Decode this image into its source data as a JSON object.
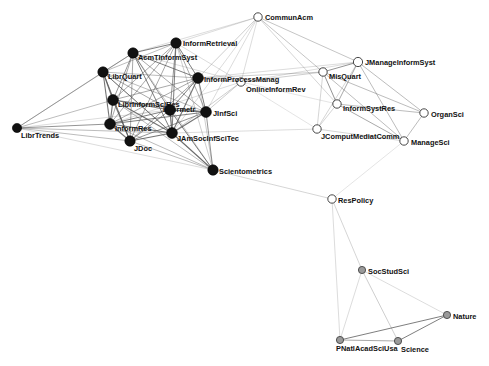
{
  "figure": {
    "type": "network-graph",
    "title": "",
    "background_color": "#ffffff",
    "edge_color": "#555555",
    "label_color": "#111111",
    "node_styles": {
      "black": {
        "fill": "#111111",
        "stroke": "#000000",
        "description": "filled black node"
      },
      "white": {
        "fill": "#ffffff",
        "stroke": "#333333",
        "description": "hollow white node"
      },
      "gray": {
        "fill": "#9a9a9a",
        "stroke": "#444444",
        "description": "gray node"
      }
    }
  },
  "chart_data": {
    "type": "scatter",
    "title": "",
    "xlabel": "",
    "ylabel": "",
    "legend": [],
    "nodes": [
      {
        "id": "CommunAcm",
        "label": "CommunAcm",
        "x": 258,
        "y": 17,
        "r": 4.2,
        "style": "white",
        "label_dx": 7,
        "label_dy": 3
      },
      {
        "id": "JAmSocInformRetr",
        "label": "InformRetrieval",
        "x": 176,
        "y": 43,
        "r": 5.2,
        "style": "black",
        "label_dx": 7,
        "label_dy": 3
      },
      {
        "id": "AcmTInformSyst",
        "label": "AcmTInformSyst",
        "x": 133,
        "y": 53,
        "r": 5.2,
        "style": "black",
        "label_dx": 5,
        "label_dy": 7
      },
      {
        "id": "JManageInformSyst",
        "label": "JManageInformSyst",
        "x": 358,
        "y": 62,
        "r": 4.6,
        "style": "white",
        "label_dx": 7,
        "label_dy": 3
      },
      {
        "id": "LibrQuart",
        "label": "LibrQuart",
        "x": 103,
        "y": 72,
        "r": 5.2,
        "style": "black",
        "label_dx": 5,
        "label_dy": 7
      },
      {
        "id": "InformProcessManag",
        "label": "InformProcessManag",
        "x": 198,
        "y": 78,
        "r": 5.4,
        "style": "black",
        "label_dx": 6,
        "label_dy": 4
      },
      {
        "id": "MisQuart",
        "label": "MisQuart",
        "x": 323,
        "y": 72,
        "r": 4.2,
        "style": "white",
        "label_dx": 6,
        "label_dy": 7
      },
      {
        "id": "OnlineInformRev",
        "label": "OnlineInformRev",
        "x": 241,
        "y": 82,
        "r": 4.2,
        "style": "white",
        "label_dx": 5,
        "label_dy": 10
      },
      {
        "id": "InformSystRes",
        "label": "InformSystRes",
        "x": 337,
        "y": 104,
        "r": 4.2,
        "style": "white",
        "label_dx": 6,
        "label_dy": 7
      },
      {
        "id": "LibrInformSciRes",
        "label": "LibrInformSciRes",
        "x": 113,
        "y": 100,
        "r": 5.4,
        "style": "black",
        "label_dx": 5,
        "label_dy": 7
      },
      {
        "id": "Informetr",
        "label": "Informetr",
        "x": 170,
        "y": 110,
        "r": 5.4,
        "style": "black",
        "label_dx": -7,
        "label_dy": 2
      },
      {
        "id": "OrganSci",
        "label": "OrganSci",
        "x": 424,
        "y": 113,
        "r": 4.2,
        "style": "white",
        "label_dx": 7,
        "label_dy": 4
      },
      {
        "id": "JInfSci",
        "label": "JInfSci",
        "x": 206,
        "y": 112,
        "r": 5.4,
        "style": "black",
        "label_dx": 7,
        "label_dy": 4
      },
      {
        "id": "JComputMediatComm",
        "label": "JComputMediatComm",
        "x": 317,
        "y": 129,
        "r": 4.2,
        "style": "white",
        "label_dx": 4,
        "label_dy": 10
      },
      {
        "id": "InformRes",
        "label": "InformRes",
        "x": 110,
        "y": 124,
        "r": 5.4,
        "style": "black",
        "label_dx": 5,
        "label_dy": 7
      },
      {
        "id": "LibrTrends",
        "label": "LibrTrends",
        "x": 17,
        "y": 128,
        "r": 4.6,
        "style": "black",
        "label_dx": 4,
        "label_dy": 10
      },
      {
        "id": "ManageSci",
        "label": "ManageSci",
        "x": 404,
        "y": 141,
        "r": 4.2,
        "style": "white",
        "label_dx": 7,
        "label_dy": 4
      },
      {
        "id": "JAmSocInfSciTec",
        "label": "JAmSocInfSciTec",
        "x": 172,
        "y": 133,
        "r": 5.4,
        "style": "black",
        "label_dx": 5,
        "label_dy": 8
      },
      {
        "id": "JDoc",
        "label": "JDoc",
        "x": 130,
        "y": 141,
        "r": 5.2,
        "style": "black",
        "label_dx": 4,
        "label_dy": 10
      },
      {
        "id": "Scientometrics",
        "label": "Scientometrics",
        "x": 213,
        "y": 170,
        "r": 5.2,
        "style": "black",
        "label_dx": 6,
        "label_dy": 4
      },
      {
        "id": "ResPolicy",
        "label": "ResPolicy",
        "x": 332,
        "y": 199,
        "r": 4.2,
        "style": "white",
        "label_dx": 6,
        "label_dy": 4
      },
      {
        "id": "SocStudSci",
        "label": "SocStudSci",
        "x": 362,
        "y": 270,
        "r": 3.6,
        "style": "gray",
        "label_dx": 6,
        "label_dy": 4
      },
      {
        "id": "Nature",
        "label": "Nature",
        "x": 447,
        "y": 315,
        "r": 3.6,
        "style": "gray",
        "label_dx": 6,
        "label_dy": 4
      },
      {
        "id": "PNatlAcadSciUsa",
        "label": "PNatlAcadSciUsa",
        "x": 340,
        "y": 340,
        "r": 3.6,
        "style": "gray",
        "label_dx": -4,
        "label_dy": 11
      },
      {
        "id": "Science",
        "label": "Science",
        "x": 398,
        "y": 341,
        "r": 3.6,
        "style": "gray",
        "label_dx": 3,
        "label_dy": 11
      }
    ],
    "edges": [
      {
        "source": "LibrTrends",
        "target": "AcmTInformSyst",
        "weight": 1
      },
      {
        "source": "LibrTrends",
        "target": "LibrQuart",
        "weight": 1
      },
      {
        "source": "LibrTrends",
        "target": "LibrInformSciRes",
        "weight": 1
      },
      {
        "source": "LibrTrends",
        "target": "InformRes",
        "weight": 1.4
      },
      {
        "source": "LibrTrends",
        "target": "JDoc",
        "weight": 1
      },
      {
        "source": "LibrTrends",
        "target": "JAmSocInfSciTec",
        "weight": 1
      },
      {
        "source": "LibrTrends",
        "target": "Informetr",
        "weight": 0.6
      },
      {
        "source": "LibrTrends",
        "target": "Scientometrics",
        "weight": 0.6
      },
      {
        "source": "LibrQuart",
        "target": "AcmTInformSyst",
        "weight": 1.2
      },
      {
        "source": "LibrQuart",
        "target": "JAmSocInformRetr",
        "weight": 1
      },
      {
        "source": "LibrQuart",
        "target": "LibrInformSciRes",
        "weight": 1.8
      },
      {
        "source": "LibrQuart",
        "target": "InformRes",
        "weight": 1.8
      },
      {
        "source": "LibrQuart",
        "target": "JDoc",
        "weight": 1.6
      },
      {
        "source": "LibrQuart",
        "target": "JAmSocInfSciTec",
        "weight": 1.6
      },
      {
        "source": "LibrQuart",
        "target": "Informetr",
        "weight": 1.2
      },
      {
        "source": "LibrQuart",
        "target": "JInfSci",
        "weight": 1
      },
      {
        "source": "LibrQuart",
        "target": "InformProcessManag",
        "weight": 1
      },
      {
        "source": "LibrQuart",
        "target": "Scientometrics",
        "weight": 0.8
      },
      {
        "source": "AcmTInformSyst",
        "target": "JAmSocInformRetr",
        "weight": 1.6
      },
      {
        "source": "AcmTInformSyst",
        "target": "InformProcessManag",
        "weight": 1.6
      },
      {
        "source": "AcmTInformSyst",
        "target": "LibrInformSciRes",
        "weight": 1.4
      },
      {
        "source": "AcmTInformSyst",
        "target": "InformRes",
        "weight": 1.2
      },
      {
        "source": "AcmTInformSyst",
        "target": "JDoc",
        "weight": 1.2
      },
      {
        "source": "AcmTInformSyst",
        "target": "JAmSocInfSciTec",
        "weight": 1.6
      },
      {
        "source": "AcmTInformSyst",
        "target": "Informetr",
        "weight": 1.4
      },
      {
        "source": "AcmTInformSyst",
        "target": "JInfSci",
        "weight": 1.2
      },
      {
        "source": "AcmTInformSyst",
        "target": "Scientometrics",
        "weight": 0.8
      },
      {
        "source": "AcmTInformSyst",
        "target": "OnlineInformRev",
        "weight": 0.6
      },
      {
        "source": "AcmTInformSyst",
        "target": "CommunAcm",
        "weight": 0.6
      },
      {
        "source": "JAmSocInformRetr",
        "target": "InformProcessManag",
        "weight": 1.6
      },
      {
        "source": "JAmSocInformRetr",
        "target": "LibrInformSciRes",
        "weight": 1.2
      },
      {
        "source": "JAmSocInformRetr",
        "target": "InformRes",
        "weight": 1.2
      },
      {
        "source": "JAmSocInformRetr",
        "target": "JDoc",
        "weight": 1.2
      },
      {
        "source": "JAmSocInformRetr",
        "target": "JAmSocInfSciTec",
        "weight": 1.6
      },
      {
        "source": "JAmSocInformRetr",
        "target": "Informetr",
        "weight": 1.4
      },
      {
        "source": "JAmSocInformRetr",
        "target": "JInfSci",
        "weight": 1.2
      },
      {
        "source": "JAmSocInformRetr",
        "target": "Scientometrics",
        "weight": 0.8
      },
      {
        "source": "JAmSocInformRetr",
        "target": "CommunAcm",
        "weight": 0.6
      },
      {
        "source": "JAmSocInformRetr",
        "target": "OnlineInformRev",
        "weight": 0.6
      },
      {
        "source": "LibrInformSciRes",
        "target": "InformRes",
        "weight": 1.8
      },
      {
        "source": "LibrInformSciRes",
        "target": "JDoc",
        "weight": 1.8
      },
      {
        "source": "LibrInformSciRes",
        "target": "JAmSocInfSciTec",
        "weight": 1.8
      },
      {
        "source": "LibrInformSciRes",
        "target": "Informetr",
        "weight": 1.6
      },
      {
        "source": "LibrInformSciRes",
        "target": "JInfSci",
        "weight": 1.4
      },
      {
        "source": "LibrInformSciRes",
        "target": "InformProcessManag",
        "weight": 1.2
      },
      {
        "source": "LibrInformSciRes",
        "target": "Scientometrics",
        "weight": 1
      },
      {
        "source": "InformRes",
        "target": "JDoc",
        "weight": 1.8
      },
      {
        "source": "InformRes",
        "target": "JAmSocInfSciTec",
        "weight": 1.8
      },
      {
        "source": "InformRes",
        "target": "Informetr",
        "weight": 1.6
      },
      {
        "source": "InformRes",
        "target": "JInfSci",
        "weight": 1.6
      },
      {
        "source": "InformRes",
        "target": "InformProcessManag",
        "weight": 1.2
      },
      {
        "source": "InformRes",
        "target": "Scientometrics",
        "weight": 1
      },
      {
        "source": "InformRes",
        "target": "OnlineInformRev",
        "weight": 0.6
      },
      {
        "source": "JDoc",
        "target": "JAmSocInfSciTec",
        "weight": 1.8
      },
      {
        "source": "JDoc",
        "target": "Informetr",
        "weight": 1.4
      },
      {
        "source": "JDoc",
        "target": "JInfSci",
        "weight": 1.4
      },
      {
        "source": "JDoc",
        "target": "InformProcessManag",
        "weight": 1.2
      },
      {
        "source": "JDoc",
        "target": "Scientometrics",
        "weight": 1
      },
      {
        "source": "JAmSocInfSciTec",
        "target": "Informetr",
        "weight": 2
      },
      {
        "source": "JAmSocInfSciTec",
        "target": "JInfSci",
        "weight": 1.8
      },
      {
        "source": "JAmSocInfSciTec",
        "target": "InformProcessManag",
        "weight": 1.8
      },
      {
        "source": "JAmSocInfSciTec",
        "target": "Scientometrics",
        "weight": 1.8
      },
      {
        "source": "JAmSocInfSciTec",
        "target": "OnlineInformRev",
        "weight": 0.8
      },
      {
        "source": "JAmSocInfSciTec",
        "target": "JComputMediatComm",
        "weight": 0.6
      },
      {
        "source": "JAmSocInfSciTec",
        "target": "CommunAcm",
        "weight": 0.6
      },
      {
        "source": "Informetr",
        "target": "JInfSci",
        "weight": 1.8
      },
      {
        "source": "Informetr",
        "target": "InformProcessManag",
        "weight": 1.6
      },
      {
        "source": "Informetr",
        "target": "Scientometrics",
        "weight": 1.6
      },
      {
        "source": "JInfSci",
        "target": "InformProcessManag",
        "weight": 1.6
      },
      {
        "source": "JInfSci",
        "target": "Scientometrics",
        "weight": 1.4
      },
      {
        "source": "JInfSci",
        "target": "OnlineInformRev",
        "weight": 0.8
      },
      {
        "source": "JInfSci",
        "target": "CommunAcm",
        "weight": 0.6
      },
      {
        "source": "InformProcessManag",
        "target": "OnlineInformRev",
        "weight": 1
      },
      {
        "source": "InformProcessManag",
        "target": "Scientometrics",
        "weight": 0.8
      },
      {
        "source": "InformProcessManag",
        "target": "CommunAcm",
        "weight": 0.8
      },
      {
        "source": "InformProcessManag",
        "target": "MisQuart",
        "weight": 0.8
      },
      {
        "source": "InformProcessManag",
        "target": "JManageInformSyst",
        "weight": 0.6
      },
      {
        "source": "OnlineInformRev",
        "target": "MisQuart",
        "weight": 0.8
      },
      {
        "source": "OnlineInformRev",
        "target": "CommunAcm",
        "weight": 0.6
      },
      {
        "source": "OnlineInformRev",
        "target": "JManageInformSyst",
        "weight": 0.6
      },
      {
        "source": "OnlineInformRev",
        "target": "InformSystRes",
        "weight": 0.5
      },
      {
        "source": "OnlineInformRev",
        "target": "JComputMediatComm",
        "weight": 0.5
      },
      {
        "source": "CommunAcm",
        "target": "MisQuart",
        "weight": 0.9
      },
      {
        "source": "CommunAcm",
        "target": "JManageInformSyst",
        "weight": 0.9
      },
      {
        "source": "CommunAcm",
        "target": "InformSystRes",
        "weight": 0.7
      },
      {
        "source": "MisQuart",
        "target": "JManageInformSyst",
        "weight": 1.4
      },
      {
        "source": "MisQuart",
        "target": "InformSystRes",
        "weight": 1.4
      },
      {
        "source": "MisQuart",
        "target": "OrganSci",
        "weight": 1
      },
      {
        "source": "MisQuart",
        "target": "ManageSci",
        "weight": 1
      },
      {
        "source": "MisQuart",
        "target": "JComputMediatComm",
        "weight": 0.7
      },
      {
        "source": "JManageInformSyst",
        "target": "InformSystRes",
        "weight": 1.2
      },
      {
        "source": "JManageInformSyst",
        "target": "OrganSci",
        "weight": 1
      },
      {
        "source": "JManageInformSyst",
        "target": "ManageSci",
        "weight": 1
      },
      {
        "source": "JManageInformSyst",
        "target": "JComputMediatComm",
        "weight": 0.7
      },
      {
        "source": "InformSystRes",
        "target": "OrganSci",
        "weight": 1
      },
      {
        "source": "InformSystRes",
        "target": "ManageSci",
        "weight": 1.2
      },
      {
        "source": "InformSystRes",
        "target": "JComputMediatComm",
        "weight": 0.7
      },
      {
        "source": "OrganSci",
        "target": "ManageSci",
        "weight": 1
      },
      {
        "source": "ManageSci",
        "target": "JComputMediatComm",
        "weight": 0.7
      },
      {
        "source": "ManageSci",
        "target": "ResPolicy",
        "weight": 0.5
      },
      {
        "source": "Scientometrics",
        "target": "ResPolicy",
        "weight": 0.7
      },
      {
        "source": "ResPolicy",
        "target": "SocStudSci",
        "weight": 0.7
      },
      {
        "source": "ResPolicy",
        "target": "PNatlAcadSciUsa",
        "weight": 0.6
      },
      {
        "source": "SocStudSci",
        "target": "Nature",
        "weight": 0.6
      },
      {
        "source": "SocStudSci",
        "target": "Science",
        "weight": 0.8
      },
      {
        "source": "SocStudSci",
        "target": "PNatlAcadSciUsa",
        "weight": 0.6
      },
      {
        "source": "Nature",
        "target": "Science",
        "weight": 1.6
      },
      {
        "source": "Nature",
        "target": "PNatlAcadSciUsa",
        "weight": 1.6
      },
      {
        "source": "Science",
        "target": "PNatlAcadSciUsa",
        "weight": 1.2
      }
    ]
  }
}
